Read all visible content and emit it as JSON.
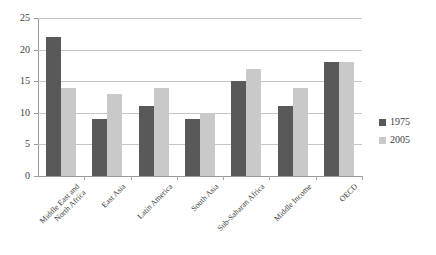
{
  "chart_data": {
    "type": "bar",
    "title": "",
    "subtitle": "",
    "xlabel": "",
    "ylabel": "",
    "ylim": [
      0,
      25
    ],
    "ytick_labels": [
      "0",
      "5",
      "10",
      "15",
      "20",
      "25"
    ],
    "ytick_values": [
      0,
      5,
      10,
      15,
      20,
      25
    ],
    "grid": true,
    "legend_position": "right",
    "categories": [
      "Middle East and\nNorth Africa",
      "East Asia",
      "Latin America",
      "South Asia",
      "Sub-Saharan Africa",
      "Middle Income",
      "OECD"
    ],
    "series": [
      {
        "name": "1975",
        "color": "#595959",
        "values": [
          22,
          9,
          11,
          9,
          15,
          11,
          18
        ]
      },
      {
        "name": "2005",
        "color": "#c9c9c9",
        "values": [
          14,
          13,
          14,
          10,
          17,
          14,
          18
        ]
      }
    ]
  },
  "legend": {
    "items": [
      {
        "label": "1975",
        "swatch": "legend-swatch-1975"
      },
      {
        "label": "2005",
        "swatch": "legend-swatch-2005"
      }
    ]
  },
  "colors": {
    "series_1975": "#595959",
    "series_2005": "#c9c9c9",
    "gridline": "#c6c6c6",
    "axis": "#9a9a9a",
    "background": "#ffffff",
    "text": "#3d3d3d"
  }
}
